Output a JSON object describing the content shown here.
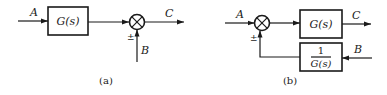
{
  "diagram_a": {
    "caption": "(a)",
    "input_label": "A",
    "block_label": "G(s)",
    "output_label": "C",
    "disturbance_label": "B",
    "sign_label": "±"
  },
  "diagram_b": {
    "caption": "(b)",
    "input_label": "A",
    "forward_block_label": "G(s)",
    "feedback_block_numerator": "1",
    "feedback_block_denominator": "G(s)",
    "output_label": "C",
    "disturbance_label": "B",
    "sign_label": "±"
  },
  "colors": {
    "stroke": "#1a1a1a",
    "background": "#ffffff"
  }
}
